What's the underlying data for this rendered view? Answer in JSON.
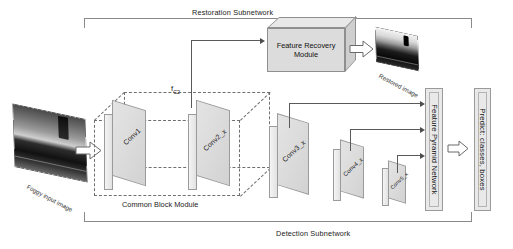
{
  "diagram": {
    "type": "neural-network-architecture"
  },
  "brackets": {
    "restoration": {
      "label": "Restoration Subnetwork"
    },
    "detection": {
      "label": "Detection Subnetwork"
    }
  },
  "common_block": {
    "caption": "Common Block Module",
    "layers": [
      {
        "label": "Conv1"
      },
      {
        "label": "Conv2_x"
      }
    ]
  },
  "feature_tap": {
    "label": "f",
    "subscript": "C2"
  },
  "restoration": {
    "module": {
      "line1": "Feature Recovery",
      "line2": "Module"
    },
    "output_image": {
      "label": "Restored image"
    }
  },
  "input": {
    "image": {
      "label": "Foggy input image"
    }
  },
  "detection": {
    "layers": [
      {
        "label": "Conv3_x"
      },
      {
        "label": "Conv4_x"
      },
      {
        "label": "Conv5_x"
      }
    ],
    "fpn": {
      "label": "Feature Pyramid Network"
    },
    "head": {
      "label": "Predict: classes, boxes"
    }
  },
  "colors": {
    "slab_face": "#dcdcdc",
    "slab_edge": "#9b9b9b",
    "line": "#5a5a5a",
    "dash": "#6f6f6f",
    "panel": "#e9e9e9"
  }
}
